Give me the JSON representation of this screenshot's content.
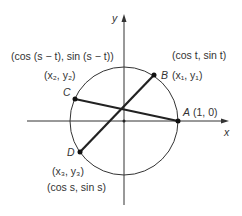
{
  "diagram": {
    "axes": {
      "x_label": "x",
      "y_label": "y"
    },
    "points": {
      "A": {
        "name": "A",
        "coords": "(1, 0)"
      },
      "B": {
        "name": "B",
        "coords": "(x₁, y₁)",
        "polar": "(cos t, sin t)"
      },
      "C": {
        "name": "C",
        "coords": "(x₂, y₂)",
        "polar": "(cos (s − t), sin (s − t))"
      },
      "D": {
        "name": "D",
        "coords": "(x₃, y₃)",
        "polar": "(cos s, sin s)"
      }
    },
    "colors": {
      "line": "#222222",
      "text": "#333333"
    }
  }
}
